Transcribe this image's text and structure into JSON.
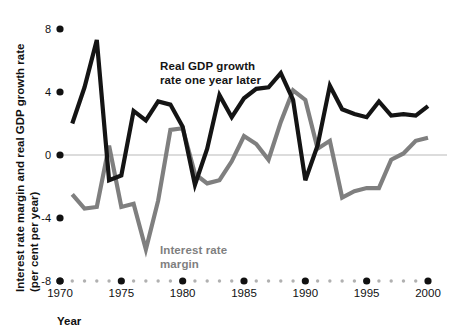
{
  "chart_data": {
    "type": "line",
    "title": "",
    "xlabel": "Year",
    "ylabel": "Interest rate margin and real GDP growth rate (per cent per year)",
    "ylabel_line1": "Interest rate margin and real GDP growth rate",
    "ylabel_line2": "(per cent per year)",
    "xlim": [
      1970,
      2000
    ],
    "ylim": [
      -8,
      8
    ],
    "yticks": [
      8,
      4,
      0,
      -4,
      -8
    ],
    "ytick_labels": [
      "8",
      "4",
      "0",
      "-4",
      "-8"
    ],
    "xticks": [
      1970,
      1975,
      1980,
      1985,
      1990,
      1995,
      2000
    ],
    "xtick_labels": [
      "1970",
      "1975",
      "1980",
      "1985",
      "1990",
      "1995",
      "2000"
    ],
    "minor_xticks": [
      1971,
      1972,
      1973,
      1974,
      1976,
      1977,
      1978,
      1979,
      1981,
      1982,
      1983,
      1984,
      1986,
      1987,
      1988,
      1989,
      1991,
      1992,
      1993,
      1994,
      1996,
      1997,
      1998,
      1999
    ],
    "grid": false,
    "zero_line": true,
    "legend_position": "inline-annotation",
    "series": [
      {
        "name": "Real GDP growth rate one year later",
        "color": "#141414",
        "label_lines": [
          "Real GDP growth",
          "rate one year later"
        ],
        "x": [
          1971,
          1972,
          1973,
          1974,
          1975,
          1976,
          1977,
          1978,
          1979,
          1980,
          1981,
          1982,
          1983,
          1984,
          1985,
          1986,
          1987,
          1988,
          1989,
          1990,
          1991,
          1992,
          1993,
          1994,
          1995,
          1996,
          1997,
          1998,
          1999,
          2000
        ],
        "values": [
          2.0,
          4.3,
          7.3,
          -1.6,
          -1.3,
          2.8,
          2.2,
          3.4,
          3.2,
          1.8,
          -1.9,
          0.4,
          3.8,
          2.4,
          3.6,
          4.2,
          4.3,
          5.2,
          3.5,
          -1.6,
          0.6,
          4.4,
          2.9,
          2.6,
          2.4,
          3.4,
          2.5,
          2.6,
          2.5,
          3.1
        ]
      },
      {
        "name": "Interest rate margin",
        "color": "#7f7f7f",
        "label_lines": [
          "Interest rate",
          "margin"
        ],
        "x": [
          1971,
          1972,
          1973,
          1974,
          1975,
          1976,
          1977,
          1978,
          1979,
          1980,
          1981,
          1982,
          1983,
          1984,
          1985,
          1986,
          1987,
          1988,
          1989,
          1990,
          1991,
          1992,
          1993,
          1994,
          1995,
          1996,
          1997,
          1998,
          1999,
          2000
        ],
        "values": [
          -2.5,
          -3.4,
          -3.3,
          0.6,
          -3.3,
          -3.1,
          -6.0,
          -2.9,
          1.6,
          1.7,
          -1.2,
          -1.8,
          -1.6,
          -0.4,
          1.2,
          0.7,
          -0.3,
          2.1,
          4.1,
          3.5,
          0.4,
          0.9,
          -2.7,
          -2.3,
          -2.1,
          -2.1,
          -0.3,
          0.1,
          0.9,
          1.1
        ]
      }
    ]
  },
  "annotations": {
    "gdp_label": {
      "line1": "Real GDP growth",
      "line2": "rate one year later"
    },
    "margin_label": {
      "line1": "Interest rate",
      "line2": "margin"
    }
  },
  "axes": {
    "x_axis_title": "Year",
    "y_axis_title_line1": "Interest rate margin and real GDP growth rate",
    "y_axis_title_line2": "(per cent per year)"
  },
  "colors": {
    "gdp_series": "#141414",
    "margin_series": "#7f7f7f",
    "zero_line": "#b9b9b9",
    "tick_major": "#111111",
    "tick_minor": "#b0b0b0",
    "background": "#ffffff"
  }
}
